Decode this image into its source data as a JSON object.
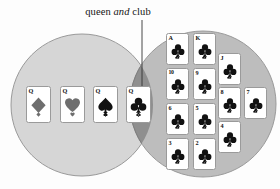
{
  "figure": {
    "type": "venn-diagram",
    "annotation": {
      "prefix": "queen ",
      "emphasis": "and",
      "suffix": " club"
    },
    "colors": {
      "left_circle_fill": "#d6d6d6",
      "right_circle_fill": "#bdbdbd",
      "intersection_fill": "#8f8f8f",
      "circle_stroke": "#9a9a9a",
      "card_face": "#ffffff",
      "card_border": "#9a9a9a",
      "pip_black": "#111111",
      "pip_gray": "#6e6e6e",
      "leader_line": "#333333",
      "background": "#fdfdfd"
    },
    "left_set": {
      "name": "queen",
      "cards": [
        {
          "rank": "Q",
          "suit": "diamond",
          "suit_symbol": "♦",
          "color": "gray",
          "x": 26,
          "y": 86
        },
        {
          "rank": "Q",
          "suit": "heart",
          "suit_symbol": "♥",
          "color": "gray",
          "x": 60,
          "y": 86
        },
        {
          "rank": "Q",
          "suit": "spade",
          "suit_symbol": "♠",
          "color": "black",
          "x": 93,
          "y": 86
        }
      ]
    },
    "intersection_set": {
      "name": "queen and club",
      "cards": [
        {
          "rank": "Q",
          "suit": "club",
          "suit_symbol": "♣",
          "color": "black",
          "x": 126,
          "y": 86
        }
      ]
    },
    "right_set": {
      "name": "club",
      "cards": [
        {
          "rank": "A",
          "suit": "club",
          "suit_symbol": "♣",
          "color": "black",
          "x": 166,
          "y": 33
        },
        {
          "rank": "K",
          "suit": "club",
          "suit_symbol": "♣",
          "color": "black",
          "x": 193,
          "y": 33
        },
        {
          "rank": "J",
          "suit": "club",
          "suit_symbol": "♣",
          "color": "black",
          "x": 218,
          "y": 53
        },
        {
          "rank": "10",
          "suit": "club",
          "suit_symbol": "♣",
          "color": "black",
          "x": 166,
          "y": 68
        },
        {
          "rank": "9",
          "suit": "club",
          "suit_symbol": "♣",
          "color": "black",
          "x": 193,
          "y": 68
        },
        {
          "rank": "8",
          "suit": "club",
          "suit_symbol": "♣",
          "color": "black",
          "x": 218,
          "y": 87
        },
        {
          "rank": "7",
          "suit": "club",
          "suit_symbol": "♣",
          "color": "black",
          "x": 244,
          "y": 87
        },
        {
          "rank": "6",
          "suit": "club",
          "suit_symbol": "♣",
          "color": "black",
          "x": 166,
          "y": 103
        },
        {
          "rank": "5",
          "suit": "club",
          "suit_symbol": "♣",
          "color": "black",
          "x": 193,
          "y": 103
        },
        {
          "rank": "4",
          "suit": "club",
          "suit_symbol": "♣",
          "color": "black",
          "x": 218,
          "y": 121
        },
        {
          "rank": "3",
          "suit": "club",
          "suit_symbol": "♣",
          "color": "black",
          "x": 166,
          "y": 138
        },
        {
          "rank": "2",
          "suit": "club",
          "suit_symbol": "♣",
          "color": "black",
          "x": 193,
          "y": 138
        }
      ]
    },
    "geometry": {
      "left_circle": {
        "cx": 82,
        "cy": 105,
        "r": 71
      },
      "right_circle": {
        "cx": 203,
        "cy": 104,
        "r": 73
      },
      "leader_line": {
        "x1": 142,
        "y1": 20,
        "x2": 142,
        "y2": 88
      }
    }
  }
}
